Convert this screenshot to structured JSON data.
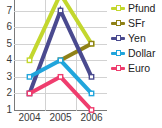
{
  "chart_data": {
    "type": "line",
    "title": "",
    "xlabel": "",
    "ylabel": "",
    "categories": [
      "2004",
      "2005",
      "2006"
    ],
    "x": [
      2004,
      2005,
      2006
    ],
    "ylim": [
      1,
      8
    ],
    "yticks": [
      "1",
      "2",
      "3",
      "4",
      "5",
      "6",
      "7",
      "8"
    ],
    "grid": true,
    "legend_position": "right",
    "series": [
      {
        "name": "Pfund",
        "color": "#c3d72e",
        "values": [
          4,
          8,
          5
        ]
      },
      {
        "name": "SFr",
        "color": "#8f8116",
        "values": [
          null,
          4,
          5
        ]
      },
      {
        "name": "Yen",
        "color": "#4a4a8f",
        "values": [
          2,
          7,
          3
        ]
      },
      {
        "name": "Dollar",
        "color": "#21a5dc",
        "values": [
          3,
          4,
          2
        ]
      },
      {
        "name": "Euro",
        "color": "#ef3d6e",
        "values": [
          2,
          3,
          1
        ]
      }
    ]
  },
  "legend": {
    "items": [
      {
        "label": "Pfund",
        "color": "#c3d72e"
      },
      {
        "label": "SFr",
        "color": "#8f8116"
      },
      {
        "label": "Yen",
        "color": "#4a4a8f"
      },
      {
        "label": "Dollar",
        "color": "#21a5dc"
      },
      {
        "label": "Euro",
        "color": "#ef3d6e"
      }
    ]
  },
  "axes": {
    "y_ticks": [
      "8",
      "7",
      "6",
      "5",
      "4",
      "3",
      "2",
      "1"
    ],
    "x_ticks": [
      "2004",
      "2005",
      "2006"
    ]
  }
}
